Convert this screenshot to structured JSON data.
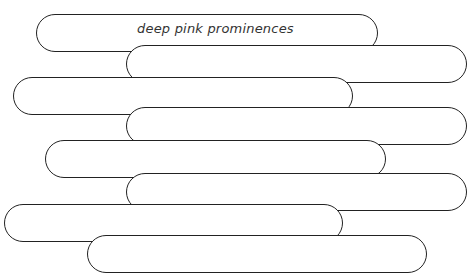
{
  "worksheet": {
    "bars": [
      {
        "text": "deep pink prominences"
      },
      {
        "text": ""
      },
      {
        "text": ""
      },
      {
        "text": ""
      },
      {
        "text": ""
      },
      {
        "text": ""
      },
      {
        "text": ""
      },
      {
        "text": ""
      }
    ]
  },
  "colors": {
    "outline": "#222222",
    "background": "#ffffff",
    "text": "#333333"
  }
}
